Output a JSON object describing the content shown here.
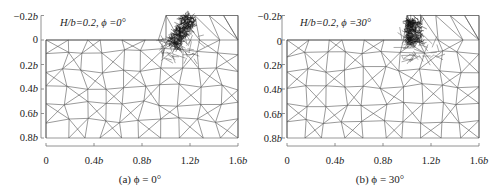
{
  "figure": {
    "panels": [
      {
        "id": "a",
        "annotation": "H/b=0.2, ϕ =0°",
        "caption": "(a) ϕ = 0°",
        "phi_deg": 0,
        "H_over_b": 0.2
      },
      {
        "id": "b",
        "annotation": "H/b=0.2, ϕ =30°",
        "caption": "(b) ϕ = 30°",
        "phi_deg": 30,
        "H_over_b": 0.2
      }
    ],
    "y_ticks": [
      "−0.2b",
      "0",
      "0.2b",
      "0.4b",
      "0.6b",
      "0.8b"
    ],
    "x_ticks": [
      "0",
      "0.4b",
      "0.8b",
      "1.2b",
      "1.6b"
    ],
    "colors": {
      "mesh": "#555555",
      "dense_mesh": "#111111",
      "axis": "#777777",
      "text": "#222222"
    }
  },
  "chart_data": {
    "type": "mesh",
    "xlabel": "",
    "ylabel": "",
    "xlim": [
      0,
      1.6
    ],
    "ylim": [
      0.8,
      -0.2
    ],
    "x_ticks": [
      0,
      0.4,
      0.8,
      1.2,
      1.6
    ],
    "y_ticks": [
      -0.2,
      0,
      0.2,
      0.4,
      0.6,
      0.8
    ],
    "tick_unit": "b",
    "panels": [
      {
        "label": "(a) ϕ = 0°",
        "annotation": "H/b=0.2, ϕ =0°",
        "step_x": 1.0,
        "step_height": 0.2,
        "refinement": "dense mesh at step corner, fan extending up-right"
      },
      {
        "label": "(b) ϕ = 30°",
        "annotation": "H/b=0.2, ϕ =30°",
        "step_x": 1.0,
        "step_height": 0.2,
        "refinement": "dense mesh concentrated along vertical step face"
      }
    ],
    "grid": false,
    "legend": null
  }
}
